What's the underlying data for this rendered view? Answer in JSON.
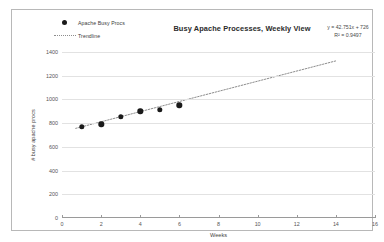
{
  "chart_data": {
    "type": "scatter",
    "title": "Busy Apache Processes, Weekly View",
    "xlabel": "Weeks",
    "ylabel": "# busy apache procs",
    "x": [
      1,
      2,
      3,
      4,
      5,
      6
    ],
    "categories": [
      1,
      2,
      3,
      4,
      5,
      6
    ],
    "values": [
      770,
      790,
      855,
      900,
      915,
      950
    ],
    "series": [
      {
        "name": "Apache Busy Procs",
        "type": "scatter",
        "marker": "filled-circle",
        "color": "#1a1a1a",
        "values": [
          770,
          790,
          855,
          900,
          915,
          950
        ]
      },
      {
        "name": "Trendline",
        "type": "line",
        "style": "dotted",
        "color": "#8d8d8d",
        "x_start": 0.7,
        "x_end": 14.0,
        "y_start": 756,
        "y_end": 1325
      }
    ],
    "xlim": [
      0,
      16
    ],
    "ylim": [
      0,
      1400
    ],
    "xticks": [
      0,
      2,
      4,
      6,
      8,
      10,
      12,
      14,
      16
    ],
    "yticks": [
      0,
      200,
      400,
      600,
      800,
      1000,
      1200,
      1400
    ],
    "ytick_labels": [
      "0",
      "200",
      "400",
      "600",
      "800",
      "1000",
      "1200",
      "1400"
    ],
    "xtick_labels": [
      "0",
      "2",
      "4",
      "6",
      "8",
      "10",
      "12",
      "14",
      "16"
    ],
    "grid": "horizontal",
    "legend_position": "top-left",
    "annotations": {
      "equation": "y = 42.751x + 726",
      "r_squared": "R² = 0.9497",
      "slope": 42.751,
      "intercept": 726,
      "r2_value": 0.9497
    }
  },
  "legend": {
    "items": [
      {
        "label": "Apache Busy Procs",
        "marker": "filled-circle"
      },
      {
        "label": "Trendline",
        "marker": "dotted-line"
      }
    ]
  },
  "colors": {
    "marker": "#1a1a1a",
    "trendline": "#8d8d8d",
    "gridline": "#e2e2e2",
    "axis": "#9a9a9a",
    "frame": "#b8b8b8",
    "background": "#ffffff"
  }
}
